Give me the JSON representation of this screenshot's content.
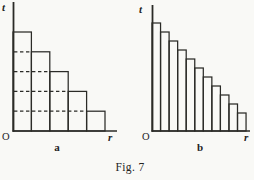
{
  "figure": {
    "caption": "Fig. 7",
    "line_color": "#2b2b27",
    "background": "#f9f9f6",
    "panels": [
      {
        "label": "a",
        "y_axis_label": "t",
        "x_axis_label": "r",
        "origin_label": "O",
        "bars": [
          5,
          4,
          3,
          2,
          1
        ],
        "dashed_gridlines": true
      },
      {
        "label": "b",
        "y_axis_label": "t",
        "x_axis_label": "r",
        "origin_label": "O",
        "bars": [
          12,
          11,
          10,
          9,
          8,
          7,
          6,
          5,
          4,
          3,
          2
        ],
        "dashed_gridlines": false
      }
    ]
  }
}
